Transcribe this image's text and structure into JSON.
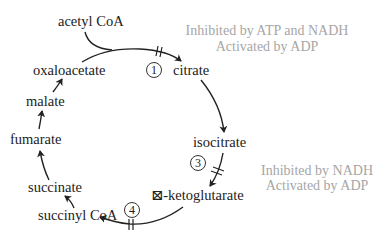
{
  "diagram": {
    "metabolites": {
      "acetyl_coa": "acetyl CoA",
      "oxaloacetate": "oxaloacetate",
      "citrate": "citrate",
      "malate": "malate",
      "fumarate": "fumarate",
      "isocitrate": "isocitrate",
      "succinate": "succinate",
      "alpha_ketoglutarate": "⊠-ketoglutarate",
      "succinyl_coa": "succinyl CoA"
    },
    "steps": {
      "step1": "1",
      "step3": "3",
      "step4": "4"
    },
    "regulation": {
      "step1": {
        "line1": "Inhibited by ATP and NADH",
        "line2": "Activated by ADP"
      },
      "step3": {
        "line1": "Inhibited by NADH",
        "line2": "Activated by ADP"
      }
    },
    "colors": {
      "text": "#222222",
      "note": "#a6a6a6",
      "arrow": "#222222"
    }
  }
}
